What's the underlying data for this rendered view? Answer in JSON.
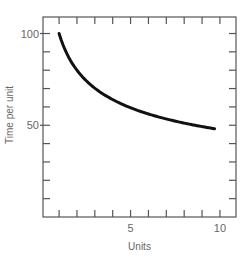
{
  "chart_data": {
    "type": "line",
    "title": "",
    "xlabel": "Units",
    "ylabel": "Time per unit",
    "xlim": [
      0.1,
      10.9
    ],
    "ylim": [
      0,
      109
    ],
    "x_ticks": [
      1,
      2,
      3,
      4,
      5,
      6,
      7,
      8,
      9,
      10
    ],
    "x_tick_labels": [
      {
        "value": 5,
        "label": "5"
      },
      {
        "value": 10,
        "label": "10"
      }
    ],
    "y_ticks": [
      10,
      20,
      30,
      40,
      50,
      60,
      70,
      80,
      90,
      100
    ],
    "y_tick_labels": [
      {
        "value": 50,
        "label": "50"
      },
      {
        "value": 100,
        "label": "100"
      }
    ],
    "grid": false,
    "legend": null,
    "series": [
      {
        "name": "Learning curve",
        "x": [
          1,
          1.5,
          2,
          2.5,
          3,
          4,
          5,
          6,
          7,
          8,
          9,
          9.7
        ],
        "values": [
          100,
          87.8,
          80,
          74.5,
          70.2,
          64,
          59.6,
          56.2,
          53.5,
          51.2,
          49.3,
          48.1
        ]
      }
    ]
  }
}
